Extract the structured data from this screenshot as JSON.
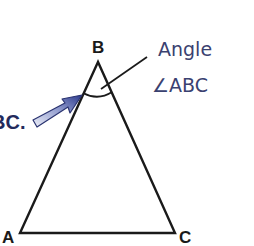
{
  "diagram": {
    "type": "geometry-triangle",
    "vertices": [
      {
        "label": "A",
        "x": 20,
        "y": 233
      },
      {
        "label": "B",
        "x": 98,
        "y": 62
      },
      {
        "label": "C",
        "x": 175,
        "y": 233
      }
    ],
    "annotation": {
      "line1": "Angle",
      "line2": "∠ABC"
    },
    "partial_text": "BC.",
    "colors": {
      "stroke": "#1a1a1a",
      "annotation_text": "#3a4170",
      "partial_text": "#232a5c",
      "arrow_fill_start": "#2c3a8c",
      "arrow_fill_end": "#e6e9f5"
    }
  }
}
